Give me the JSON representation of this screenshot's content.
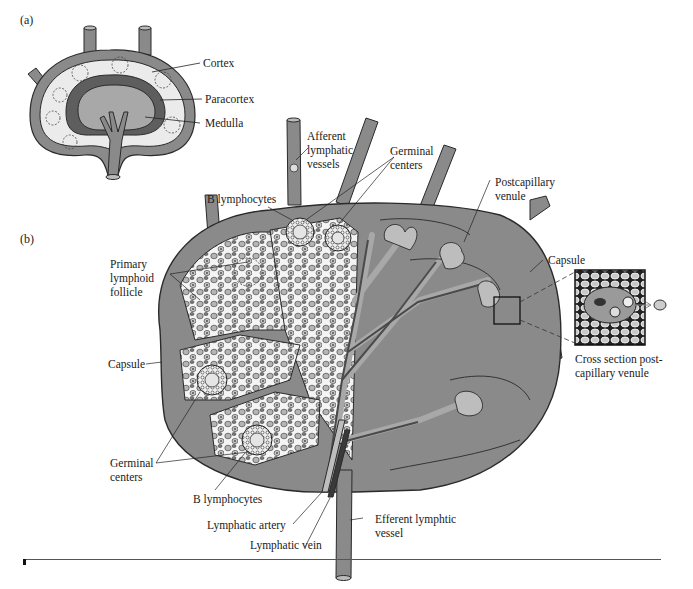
{
  "figure": {
    "panel_a": {
      "tag": "(a)",
      "labels": {
        "cortex": "Cortex",
        "paracortex": "Paracortex",
        "medulla": "Medulla"
      }
    },
    "panel_b": {
      "tag": "(b)",
      "labels": {
        "afferent": [
          "Afferent",
          "lymphatic",
          "vessels"
        ],
        "germinal_top": [
          "Germinal",
          "centers"
        ],
        "b_lymph_top": "B lymphocytes",
        "primary_follicle": [
          "Primary",
          "lymphoid",
          "follicle"
        ],
        "postcapillary": [
          "Postcapillary",
          "venule"
        ],
        "capsule_right": "Capsule",
        "capsule_left": "Capsule",
        "cross_section": [
          "Cross section post-",
          "capillary venule"
        ],
        "germinal_bottom": [
          "Germinal",
          "centers"
        ],
        "b_lymph_bottom": "B lymphocytes",
        "lymph_artery": "Lymphatic artery",
        "lymph_vein": "Lymphatic vein",
        "efferent": [
          "Efferent lymphtic",
          "vessel"
        ]
      }
    },
    "colors": {
      "tissue": "#8a8a8a",
      "tissue_light": "#a8a8a8",
      "paracortex": "#5e5e5e",
      "cortex_fill": "#e8e8e8",
      "outline": "#2a2a2a",
      "cell_fill": "#b5b5b5"
    }
  }
}
